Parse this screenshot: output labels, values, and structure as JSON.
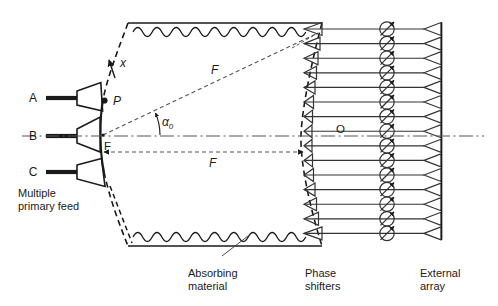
{
  "diagram": {
    "title_internal": "lens-fed-array-schematic",
    "colors": {
      "line": "#1a1a1a",
      "text": "#1a1a1a",
      "background": "#ffffff",
      "thin": "#333333"
    },
    "feed_ports": [
      {
        "id": "A",
        "label": "A"
      },
      {
        "id": "B",
        "label": "B"
      },
      {
        "id": "C",
        "label": "C"
      }
    ],
    "point_labels": [
      {
        "id": "x",
        "label": "x"
      },
      {
        "id": "P",
        "label": "P"
      },
      {
        "id": "F",
        "label": "F"
      },
      {
        "id": "O",
        "label": "O"
      }
    ],
    "dimension_labels": [
      {
        "id": "F-slant",
        "label": "F"
      },
      {
        "id": "F-axial",
        "label": "F"
      }
    ],
    "angle_label": {
      "symbol": "α",
      "subscript": "0"
    },
    "captions": [
      {
        "id": "multiple-primary-feed",
        "lines": [
          "Multiple",
          "primary feed"
        ]
      },
      {
        "id": "absorbing-material",
        "lines": [
          "Absorbing",
          "material"
        ]
      },
      {
        "id": "phase-shifters",
        "lines": [
          "Phase",
          "shifters"
        ]
      },
      {
        "id": "external-array",
        "lines": [
          "External",
          "array"
        ]
      }
    ],
    "element_counts": {
      "phase_shifters": 15,
      "external_array_horns": 15,
      "inner_array_horns": 15,
      "primary_feed_horns": 3
    },
    "icons": [
      {
        "name": "phase-shifter-icon",
        "glyph": "circle-with-diagonal-arrow"
      },
      {
        "name": "horn-antenna-icon",
        "glyph": "open-triangle"
      },
      {
        "name": "absorbing-material-icon",
        "glyph": "scalloped-wave"
      }
    ]
  }
}
